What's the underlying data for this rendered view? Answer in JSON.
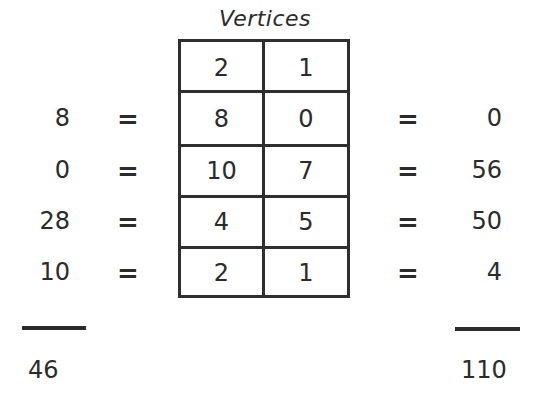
{
  "title": "Vertices",
  "table": {
    "rows": [
      [
        "2",
        "1"
      ],
      [
        "8",
        "0"
      ],
      [
        "10",
        "7"
      ],
      [
        "4",
        "5"
      ],
      [
        "2",
        "1"
      ]
    ]
  },
  "left_products": [
    "8",
    "0",
    "28",
    "10"
  ],
  "right_products": [
    "0",
    "56",
    "50",
    "4"
  ],
  "equals_symbol": "=",
  "totals": {
    "left": "46",
    "right": "110"
  }
}
